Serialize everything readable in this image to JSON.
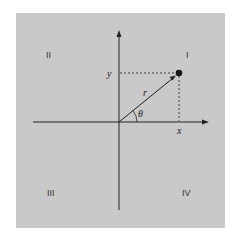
{
  "diagram": {
    "type": "polar-coordinates-cartesian-plane",
    "background_color": "#c9c9c9",
    "quadrants": [
      {
        "id": "I",
        "label": "I"
      },
      {
        "id": "II",
        "label": "II"
      },
      {
        "id": "III",
        "label": "III"
      },
      {
        "id": "IV",
        "label": "IV"
      }
    ],
    "point": {
      "x_label": "x",
      "y_label": "y"
    },
    "vector": {
      "label": "r"
    },
    "angle": {
      "label": "θ"
    }
  }
}
